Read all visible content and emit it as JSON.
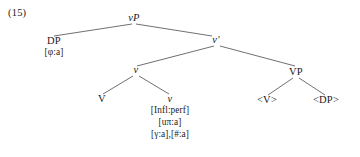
{
  "example": {
    "number": "(15)"
  },
  "tree": {
    "nodes": {
      "root": {
        "label": "vP"
      },
      "spec_dp": {
        "label": "DP",
        "features": [
          "[φ:a]"
        ]
      },
      "vbar": {
        "label": "v′"
      },
      "inner_v": {
        "label": "v"
      },
      "terminal_V": {
        "label": "V"
      },
      "terminal_v": {
        "label": "v",
        "features": [
          "[Infl:perf]",
          "[uπ:a]",
          "[γ:a],[#:a]"
        ]
      },
      "vp": {
        "label": "VP"
      },
      "trace_V": {
        "label": "<V>"
      },
      "trace_DP": {
        "label": "<DP>"
      }
    }
  },
  "style": {
    "line_color": "#4a4a52",
    "text_color": "#1a1a1a",
    "background": "#ffffff"
  }
}
